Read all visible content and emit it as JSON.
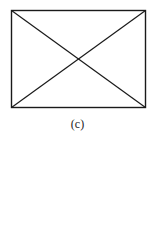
{
  "figure": {
    "caption": "(c)",
    "shape": "rectangle-with-diagonals",
    "rect": {
      "x1": 11,
      "y1": 10,
      "x2": 145,
      "y2": 107
    },
    "stroke_color": "#1a1a1a"
  }
}
